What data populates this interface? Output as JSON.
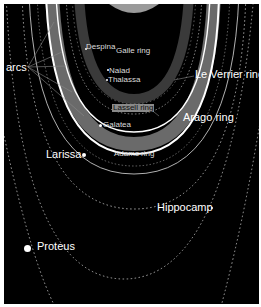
{
  "diagram": {
    "colors": {
      "background": "#000000",
      "rings": "#ffffff",
      "ring_band": "#6a6a6a",
      "border": "#ffffff"
    },
    "labels": {
      "arcs": "arcs",
      "despina": "Despina",
      "galle_ring": "Galle ring",
      "naiad": "Naiad",
      "thalassa": "Thalassa",
      "le_verrier_ring": "Le Verrier ring",
      "lassell_ring": "Lassell ring",
      "galatea": "Galatea",
      "arago_ring": "Arago ring",
      "larissa": "Larissa",
      "adams_ring": "Adams ring",
      "hippocamp": "Hippocamp",
      "proteus": "Proteus"
    },
    "moons": [
      "Naiad",
      "Thalassa",
      "Despina",
      "Galatea",
      "Larissa",
      "Hippocamp",
      "Proteus"
    ],
    "rings": [
      "Galle ring",
      "Le Verrier ring",
      "Lassell ring",
      "Arago ring",
      "Adams ring"
    ]
  }
}
